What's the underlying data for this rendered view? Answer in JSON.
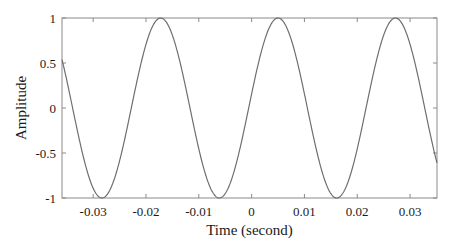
{
  "chart_data": {
    "type": "line",
    "title": "",
    "xlabel": "Time (second)",
    "ylabel": "Amplitude",
    "xlim": [
      -0.0359,
      0.0351
    ],
    "ylim": [
      -1,
      1
    ],
    "grid": false,
    "legend": null,
    "x_ticks": [
      -0.03,
      -0.02,
      -0.01,
      0,
      0.01,
      0.02,
      0.03
    ],
    "x_tick_labels": [
      "-0.03",
      "-0.02",
      "-0.01",
      "0",
      "0.01",
      "0.02",
      "0.03"
    ],
    "y_ticks": [
      1,
      0.5,
      0,
      -0.5,
      -1
    ],
    "y_tick_labels": [
      "1",
      "0.5",
      "0",
      "-0.5",
      "-1"
    ],
    "series": [
      {
        "name": "signal",
        "function": "cos(2*pi*45*(t-0.005))",
        "frequency_hz": 45,
        "amplitude": 1,
        "peak_times": [
          -0.0173,
          0.005,
          0.0274
        ],
        "trough_times": [
          -0.0284,
          -0.0062,
          0.0161
        ],
        "start_value": 0.55,
        "end_value": -0.55,
        "color": "#6e6e6e"
      }
    ]
  },
  "style": {
    "frame_color": "#8a8a8a",
    "line_color": "#6e6e6e",
    "text_color": "#1a1a1a"
  }
}
